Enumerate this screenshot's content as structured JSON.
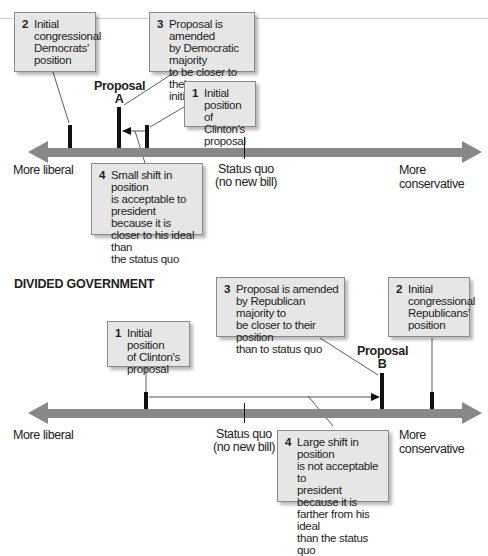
{
  "unified_government": {
    "proposal_label": "Proposal\nA",
    "axis": {
      "left_label": "More liberal",
      "right_label": "More conservative",
      "status_quo_label": "Status quo\n(no new bill)"
    },
    "callouts": [
      {
        "num": "1",
        "text": "Initial position\nof Clinton's\nproposal"
      },
      {
        "num": "2",
        "text": "Initial\ncongressional\nDemocrats'\nposition"
      },
      {
        "num": "3",
        "text": "Proposal is amended\nby Democratic majority\nto be closer to their\ninitial position"
      },
      {
        "num": "4",
        "text": "Small shift in position\nis acceptable to\npresident because it is\ncloser to his ideal than\nthe status quo"
      }
    ]
  },
  "divided_government": {
    "section_title": "DIVIDED GOVERNMENT",
    "proposal_label": "Proposal\nB",
    "axis": {
      "left_label": "More liberal",
      "right_label": "More conservative",
      "status_quo_label": "Status quo\n(no new bill)"
    },
    "callouts": [
      {
        "num": "1",
        "text": "Initial position\nof Clinton's\nproposal"
      },
      {
        "num": "2",
        "text": "Initial\ncongressional\nRepublicans'\nposition"
      },
      {
        "num": "3",
        "text": "Proposal is amended\nby Republican majority to\nbe closer to their position\nthan to status quo"
      },
      {
        "num": "4",
        "text": "Large shift in position\nis not acceptable to\npresident because it is\nfarther from his ideal\nthan the status quo"
      }
    ]
  },
  "colors": {
    "axis": "#888888",
    "box_fill": "#e6e6e6",
    "box_border": "#8a8a8a",
    "marker": "#111111"
  }
}
